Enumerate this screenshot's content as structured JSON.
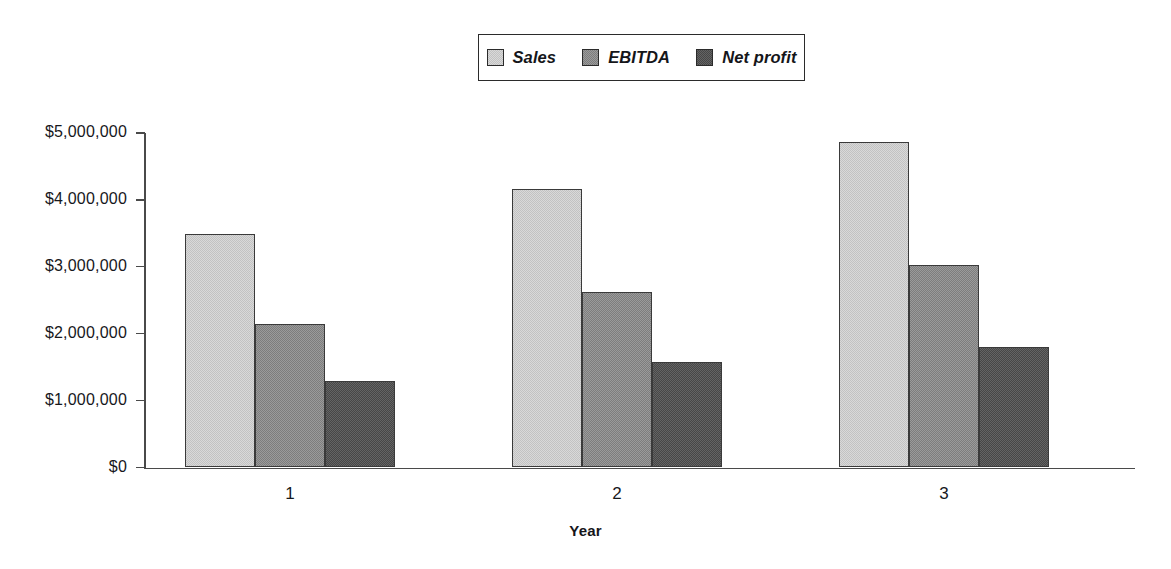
{
  "chart_data": {
    "type": "bar",
    "title": "",
    "xlabel": "Year",
    "ylabel": "",
    "categories": [
      "1",
      "2",
      "3"
    ],
    "series": [
      {
        "name": "Sales",
        "values": [
          3490000,
          4160000,
          4870000
        ],
        "color": "#d9d9d9"
      },
      {
        "name": "EBITDA",
        "values": [
          2140000,
          2630000,
          3020000
        ],
        "color": "#9b9b9b"
      },
      {
        "name": "Net profit",
        "values": [
          1290000,
          1570000,
          1800000
        ],
        "color": "#646464"
      }
    ],
    "ylim": [
      0,
      5000000
    ],
    "ytick_values": [
      0,
      1000000,
      2000000,
      3000000,
      4000000,
      5000000
    ],
    "ytick_labels": [
      "$0",
      "$1,000,000",
      "$2,000,000",
      "$3,000,000",
      "$4,000,000",
      "$5,000,000"
    ],
    "grid": false,
    "legend_position": "top-center",
    "legend_boxed": true
  },
  "legend": {
    "items": [
      {
        "label": "Sales"
      },
      {
        "label": "EBITDA"
      },
      {
        "label": "Net profit"
      }
    ]
  },
  "axes": {
    "x_title": "Year",
    "x_categories": [
      "1",
      "2",
      "3"
    ],
    "y_labels": [
      "$5,000,000",
      "$4,000,000",
      "$3,000,000",
      "$2,000,000",
      "$1,000,000",
      "$0"
    ]
  },
  "colors": {
    "sales": "#d9d9d9",
    "ebitda": "#9b9b9b",
    "net_profit": "#646464",
    "axis": "#4a4a4a",
    "outline": "#3a3a3a",
    "text": "#17181c",
    "background": "#ffffff"
  }
}
